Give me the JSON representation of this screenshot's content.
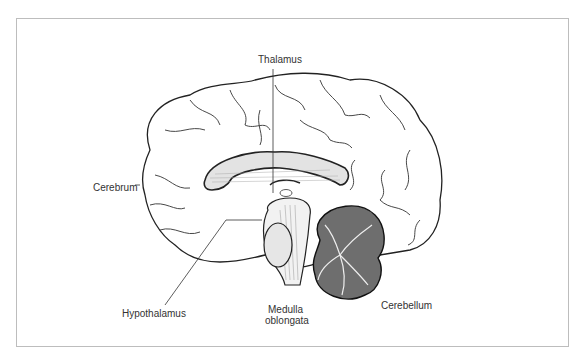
{
  "diagram": {
    "type": "anatomical-illustration",
    "labels": [
      {
        "id": "thalamus",
        "text": "Thalamus"
      },
      {
        "id": "cerebrum",
        "text": "Cerebrum"
      },
      {
        "id": "hypothalamus",
        "text": "Hypothalamus"
      },
      {
        "id": "medulla",
        "line1": "Medulla",
        "line2": "oblongata"
      },
      {
        "id": "cerebellum",
        "text": "Cerebellum"
      }
    ],
    "colors": {
      "line": "#222222",
      "cerebellum": "#6e6e6e",
      "frame": "#bdbdbd",
      "text": "#333333"
    }
  }
}
